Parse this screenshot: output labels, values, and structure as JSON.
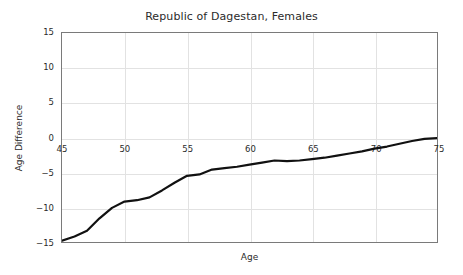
{
  "figure": {
    "title": "Republic of Dagestan, Females",
    "background_color": "#ffffff",
    "axes_color": "#7a7a7a",
    "grid_color": "#e2e2e2",
    "text_color": "#2b2b2b"
  },
  "chart_data": {
    "type": "line",
    "title": "Republic of Dagestan, Females",
    "xlabel": "Age",
    "ylabel": "Age Difference",
    "xlim": [
      45,
      75
    ],
    "ylim": [
      -15,
      15
    ],
    "xticks": [
      45,
      50,
      55,
      60,
      65,
      70,
      75
    ],
    "xtick_labels": [
      "45",
      "50",
      "55",
      "60",
      "65",
      "70",
      "75"
    ],
    "yticks": [
      15,
      10,
      5,
      0,
      -5,
      -10,
      -15
    ],
    "ytick_labels": [
      "15",
      "10",
      "5",
      "0",
      "-5",
      "-10",
      "-15"
    ],
    "grid": true,
    "legend": false,
    "line_color": "#111111",
    "line_width": 2.2,
    "series": [
      {
        "name": "Age Difference",
        "x": [
          45,
          46,
          47,
          48,
          49,
          50,
          51,
          52,
          53,
          54,
          55,
          56,
          57,
          58,
          59,
          60,
          61,
          62,
          63,
          64,
          65,
          66,
          67,
          68,
          69,
          70,
          71,
          72,
          73,
          74,
          75
        ],
        "y": [
          -14.8,
          -14.2,
          -13.4,
          -11.6,
          -10.1,
          -9.2,
          -9.0,
          -8.6,
          -7.6,
          -6.5,
          -5.5,
          -5.3,
          -4.6,
          -4.4,
          -4.2,
          -3.9,
          -3.6,
          -3.3,
          -3.4,
          -3.3,
          -3.1,
          -2.9,
          -2.6,
          -2.3,
          -2.0,
          -1.6,
          -1.3,
          -0.9,
          -0.5,
          -0.2,
          -0.1
        ]
      }
    ]
  }
}
